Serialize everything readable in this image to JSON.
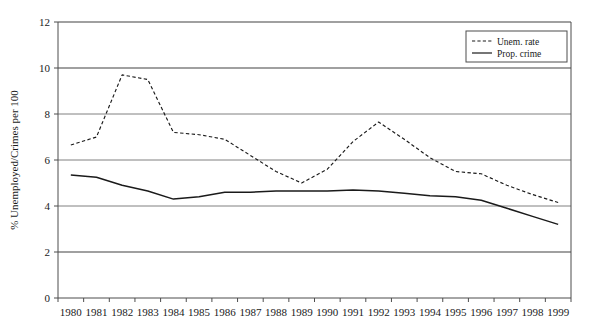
{
  "chart_data": {
    "type": "line",
    "title": "",
    "subtitle": "",
    "xlabel": "",
    "ylabel": "% Unemployed/Crimes per 100",
    "x": [
      "1980",
      "1981",
      "1982",
      "1983",
      "1984",
      "1985",
      "1986",
      "1987",
      "1988",
      "1989",
      "1990",
      "1991",
      "1992",
      "1993",
      "1994",
      "1995",
      "1996",
      "1997",
      "1998",
      "1999"
    ],
    "categories": [
      "1980",
      "1981",
      "1982",
      "1983",
      "1984",
      "1985",
      "1986",
      "1987",
      "1988",
      "1989",
      "1990",
      "1991",
      "1992",
      "1993",
      "1994",
      "1995",
      "1996",
      "1997",
      "1998",
      "1999"
    ],
    "series": [
      {
        "name": "Unem. rate",
        "style": "dashed",
        "color": "#1a1a1a",
        "values": [
          6.65,
          7.0,
          9.7,
          9.5,
          7.2,
          7.1,
          6.9,
          6.2,
          5.5,
          5.0,
          5.6,
          6.8,
          7.65,
          6.9,
          6.1,
          5.5,
          5.4,
          4.9,
          4.5,
          4.15
        ]
      },
      {
        "name": "Prop. crime",
        "style": "solid",
        "color": "#1a1a1a",
        "values": [
          5.35,
          5.25,
          4.9,
          4.65,
          4.3,
          4.4,
          4.6,
          4.6,
          4.65,
          4.65,
          4.65,
          4.7,
          4.65,
          4.55,
          4.45,
          4.4,
          4.25,
          3.9,
          3.55,
          3.2
        ]
      }
    ],
    "ylim": [
      0,
      12
    ],
    "yticks": [
      0,
      2,
      4,
      6,
      8,
      10,
      12
    ],
    "ytick_labels": [
      "0",
      "2",
      "4",
      "6",
      "8",
      "10",
      "12"
    ],
    "grid": true,
    "grid_axis": "y",
    "grid_color": "#808080",
    "legend_position": "top-right",
    "axis_color": "#4d4d4d",
    "plot_background": "#ffffff"
  },
  "legend": {
    "entries": [
      {
        "label": "Unem. rate",
        "style": "dashed"
      },
      {
        "label": "Prop. crime",
        "style": "solid"
      }
    ]
  },
  "axes": {
    "y_title": "% Unemployed/Crimes per 100"
  }
}
